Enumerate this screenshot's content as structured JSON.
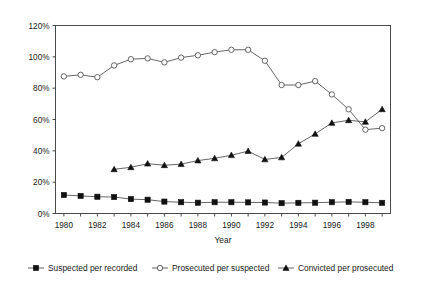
{
  "chart_data": {
    "type": "line",
    "title": "",
    "xlabel": "Year",
    "ylabel": "",
    "x": [
      1980,
      1981,
      1982,
      1983,
      1984,
      1985,
      1986,
      1987,
      1988,
      1989,
      1990,
      1991,
      1992,
      1993,
      1994,
      1995,
      1996,
      1997,
      1998,
      1999
    ],
    "xlim": [
      1979.5,
      1999.5
    ],
    "ylim": [
      0,
      120
    ],
    "ytick_labels": [
      "0%",
      "20%",
      "40%",
      "60%",
      "80%",
      "100%",
      "120%"
    ],
    "ytick_values": [
      0,
      20,
      40,
      60,
      80,
      100,
      120
    ],
    "xtick_labels": [
      "1980",
      "1982",
      "1984",
      "1986",
      "1988",
      "1990",
      "1992",
      "1994",
      "1996",
      "1998"
    ],
    "xtick_values": [
      1980,
      1982,
      1984,
      1986,
      1988,
      1990,
      1992,
      1994,
      1996,
      1998
    ],
    "grid": false,
    "legend_position": "bottom",
    "series": [
      {
        "name": "Suspected per recorded",
        "marker": "filled-square",
        "x": [
          1980,
          1981,
          1982,
          1983,
          1984,
          1985,
          1986,
          1987,
          1988,
          1989,
          1990,
          1991,
          1992,
          1993,
          1994,
          1995,
          1996,
          1997,
          1998,
          1999
        ],
        "values": [
          11.8,
          11.2,
          10.7,
          10.5,
          9.2,
          8.8,
          7.6,
          7.2,
          6.9,
          7.2,
          7.2,
          7.1,
          7.0,
          6.6,
          6.8,
          6.9,
          7.2,
          7.4,
          7.2,
          6.8
        ]
      },
      {
        "name": "Prosecuted per suspected",
        "marker": "open-circle",
        "x": [
          1980,
          1981,
          1982,
          1983,
          1984,
          1985,
          1986,
          1987,
          1988,
          1989,
          1990,
          1991,
          1992,
          1993,
          1994,
          1995,
          1996,
          1997,
          1998,
          1999
        ],
        "values": [
          87.5,
          88.5,
          87.0,
          94.5,
          98.5,
          99.0,
          96.5,
          99.5,
          101.0,
          103.0,
          104.5,
          104.5,
          97.5,
          82.0,
          82.0,
          84.5,
          76.0,
          66.5,
          53.5,
          54.5
        ]
      },
      {
        "name": "Convicted per prosecuted",
        "marker": "filled-triangle",
        "x": [
          1983,
          1984,
          1985,
          1986,
          1987,
          1988,
          1989,
          1990,
          1991,
          1992,
          1993,
          1994,
          1995,
          1996,
          1997,
          1998,
          1999
        ],
        "values": [
          28.2,
          29.5,
          31.8,
          30.8,
          31.5,
          33.8,
          35.2,
          37.2,
          39.8,
          34.5,
          35.8,
          44.5,
          50.8,
          57.8,
          59.5,
          58.5,
          66.5
        ]
      }
    ]
  },
  "legend": {
    "items": [
      {
        "label": "Suspected per recorded",
        "marker": "filled-square"
      },
      {
        "label": "Prosecuted per suspected",
        "marker": "open-circle"
      },
      {
        "label": "Convicted per prosecuted",
        "marker": "filled-triangle"
      }
    ]
  }
}
